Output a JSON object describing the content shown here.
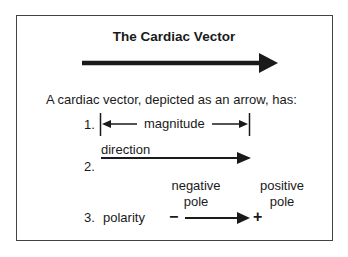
{
  "title": "The Cardiac Vector",
  "intro": "A cardiac vector, depicted as an arrow, has:",
  "items": [
    {
      "number": "1.",
      "label": "magnitude"
    },
    {
      "number": "2.",
      "label": "direction"
    },
    {
      "number": "3.",
      "label": "polarity"
    }
  ],
  "poles": {
    "negative_label_line1": "negative",
    "negative_label_line2": "pole",
    "positive_label_line1": "positive",
    "positive_label_line2": "pole",
    "negative_symbol": "−",
    "positive_symbol": "+"
  },
  "colors": {
    "ink": "#1a1a1a",
    "frame": "#444444",
    "background": "#ffffff"
  }
}
